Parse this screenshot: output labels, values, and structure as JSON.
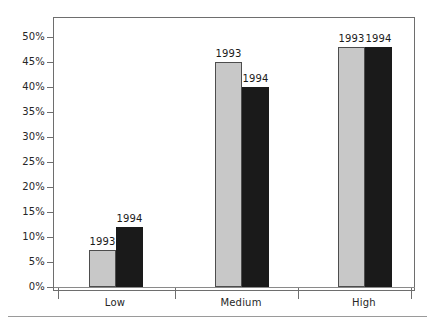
{
  "chart_data": {
    "type": "bar",
    "title": "",
    "subtitle": "",
    "xlabel": "",
    "ylabel": "",
    "categories": [
      "Low",
      "Medium",
      "High"
    ],
    "series": [
      {
        "name": "1993",
        "values": [
          7.5,
          45,
          48
        ],
        "color": "#c8c8c8"
      },
      {
        "name": "1994",
        "values": [
          12,
          40,
          48
        ],
        "color": "#1a1a1a"
      }
    ],
    "ylim": [
      0,
      50
    ],
    "ytick_step": 5,
    "ytick_labels": [
      "0%",
      "5%",
      "10%",
      "15%",
      "20%",
      "25%",
      "30%",
      "35%",
      "40%",
      "45%",
      "50%"
    ],
    "value_format": "percent",
    "grid": false,
    "legend": "none",
    "data_labels": [
      {
        "category": "Low",
        "series": "1993",
        "text": "1993"
      },
      {
        "category": "Low",
        "series": "1994",
        "text": "1994"
      },
      {
        "category": "Medium",
        "series": "1993",
        "text": "1993"
      },
      {
        "category": "Medium",
        "series": "1994",
        "text": "1994"
      },
      {
        "category": "High",
        "series": "1993",
        "text": "1993"
      },
      {
        "category": "High",
        "series": "1994",
        "text": "1994"
      }
    ],
    "frame": {
      "border_color": "#6e6e6e",
      "background": "#ffffff"
    }
  }
}
